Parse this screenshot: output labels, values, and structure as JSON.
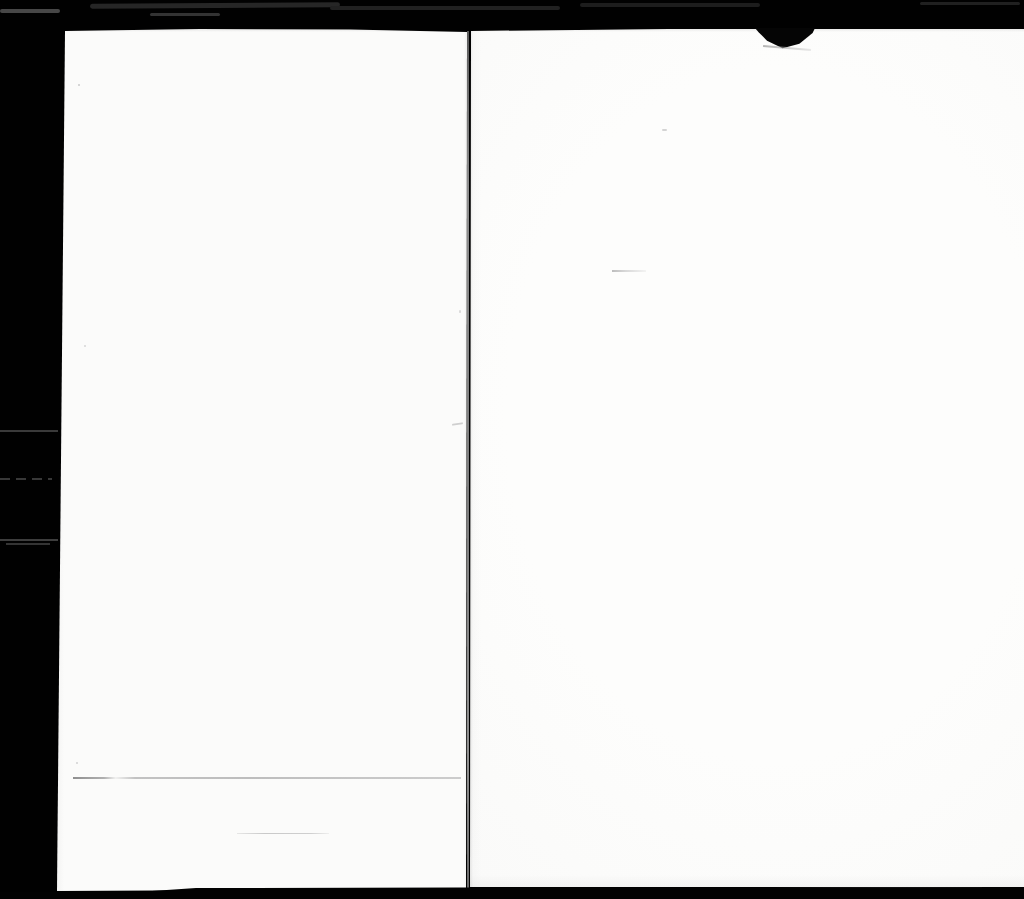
{
  "document": {
    "type": "scanned-book-spread",
    "title": "Blank book scan",
    "description": "Scanner image of an open book: two blank off-white pages separated by a center gutter line on a black scanner background; no printed text is visible",
    "left_page_label": "Left blank page",
    "right_page_label": "Right blank page",
    "spine_label": "Center spine gutter line",
    "notch_label": "Torn or folded page corner at top of right page",
    "visible_text": ""
  },
  "colors": {
    "background": "#010101",
    "page": "#fbfbfa",
    "page_edge_shadow": "#d9d9d9",
    "spine_line": "#9b9b9b",
    "faint_crease": "#bdbdbd",
    "margin_mark": "#3a3a3a"
  }
}
